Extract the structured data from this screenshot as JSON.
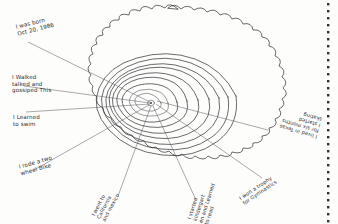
{
  "document": {
    "type": "handwritten-worksheet",
    "title": "Tree Rings Of My Life",
    "medium": "pencil on white paper",
    "ink_color": "#3a3a3c",
    "paper_color": "#fdfdfc",
    "margin_rule": "dotted vertical line at right edge"
  },
  "diagram": {
    "name": "tree-cross-section",
    "ring_count": 9,
    "center_label": "pith-dot",
    "leader_line_count": 8
  },
  "captions": [
    {
      "id": "born",
      "text": "I was born\nOct 20, 1986",
      "rotation": -14
    },
    {
      "id": "walked",
      "text": "I Walked\ntalked and\ngossiped This",
      "rotation": 0
    },
    {
      "id": "swim",
      "text": "I Learned\nto swim",
      "rotation": 0
    },
    {
      "id": "bike",
      "text": "I rode a two\nwheel Bike",
      "rotation": -16
    },
    {
      "id": "travel",
      "text": "I went to\nCalifornia\nand mexico",
      "rotation": -62
    },
    {
      "id": "kindergarten",
      "text": "I started\nkindergart\nen and Learned\nto read",
      "rotation": -72
    },
    {
      "id": "gymnastics",
      "text": "I won a trophy\nfor Gymnastics",
      "rotation": -34
    },
    {
      "id": "texas",
      "text": "I lived in Texas\nfor six months\nI started\nskating",
      "rotation": 196
    }
  ]
}
